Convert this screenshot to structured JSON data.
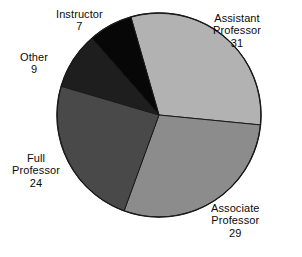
{
  "chart_data": {
    "type": "pie",
    "title": "",
    "subtitle": "",
    "xlabel": "",
    "ylabel": "",
    "legend_position": "none",
    "grid": false,
    "labels_outside": true,
    "total": 100,
    "categories": [
      "Assistant Professor",
      "Associate Professor",
      "Full Professor",
      "Other",
      "Instructor"
    ],
    "values": [
      31,
      29,
      24,
      9,
      7
    ],
    "slices": [
      {
        "label": "Assistant Professor",
        "label_line1": "Assistant",
        "label_line2": "Professor",
        "value": 31,
        "value_text": "31",
        "percent": 31,
        "angle_degrees": 111.6,
        "start_angle": -16,
        "end_angle": 95.6,
        "color": "#b2b2b2",
        "label_position": "right-top"
      },
      {
        "label": "Associate Professor",
        "label_line1": "Associate",
        "label_line2": "Professor",
        "value": 29,
        "value_text": "29",
        "percent": 29,
        "angle_degrees": 104.4,
        "start_angle": 95.6,
        "end_angle": 200,
        "color": "#8c8c8c",
        "label_position": "right-bottom"
      },
      {
        "label": "Full Professor",
        "label_line1": "Full",
        "label_line2": "Professor",
        "value": 24,
        "value_text": "24",
        "percent": 24,
        "angle_degrees": 86.4,
        "start_angle": 200,
        "end_angle": 286.4,
        "color": "#494949",
        "label_position": "left-bottom"
      },
      {
        "label": "Other",
        "label_line1": "Other",
        "label_line2": "",
        "value": 9,
        "value_text": "9",
        "percent": 9,
        "angle_degrees": 32.4,
        "start_angle": 286.4,
        "end_angle": 318.8,
        "color": "#1e1e1e",
        "label_position": "left-top"
      },
      {
        "label": "Instructor",
        "label_line1": "Instructor",
        "label_line2": "",
        "value": 7,
        "value_text": "7",
        "percent": 7,
        "angle_degrees": 25.2,
        "start_angle": 318.8,
        "end_angle": 344,
        "color": "#070707",
        "label_position": "top"
      }
    ],
    "geometry": {
      "center_x": 159,
      "center_y": 115,
      "radius": 102,
      "outline_color": "#1a1a1a"
    },
    "background_color": "#ffffff"
  }
}
